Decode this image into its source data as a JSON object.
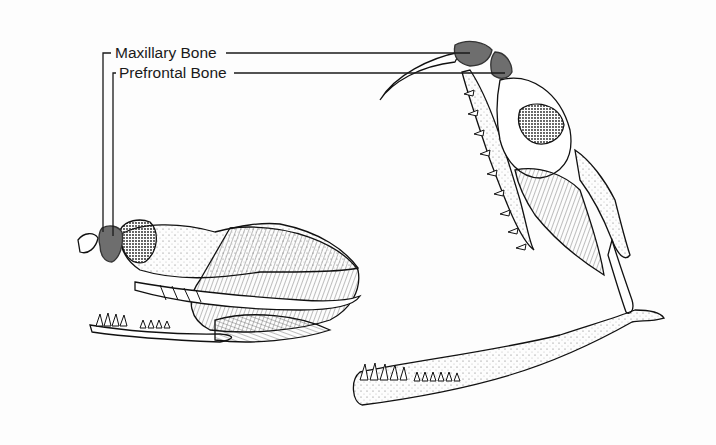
{
  "figure": {
    "highlight_color": "#6e6e6e",
    "line_color": "#1a1a1a",
    "labels": [
      {
        "id": "maxillary",
        "text": "Maxillary Bone"
      },
      {
        "id": "prefrontal",
        "text": "Prefrontal Bone"
      }
    ],
    "views": [
      {
        "id": "closed",
        "description": "Skull with jaws closed, fang folded"
      },
      {
        "id": "open",
        "description": "Skull with jaws open, fang erect"
      }
    ]
  }
}
